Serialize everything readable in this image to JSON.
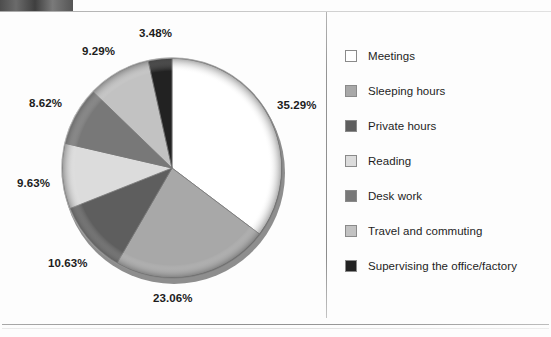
{
  "chart_data": {
    "type": "pie",
    "title": "",
    "categories": [
      "Meetings",
      "Sleeping hours",
      "Private hours",
      "Reading",
      "Desk work",
      "Travel and commuting",
      "Supervising the office/factory"
    ],
    "values": [
      35.29,
      23.06,
      10.63,
      9.63,
      8.62,
      9.29,
      3.48
    ],
    "value_labels": [
      "35.29%",
      "23.06%",
      "10.63%",
      "9.63%",
      "8.62%",
      "9.29%",
      "3.48%"
    ],
    "unit": "%",
    "colors": [
      "#ffffff",
      "#a8a8a8",
      "#5e5e5e",
      "#dcdcdc",
      "#787878",
      "#c2c2c2",
      "#222222"
    ],
    "start_angle_deg": 0,
    "direction": "clockwise",
    "legend_position": "right",
    "grid": false,
    "labels_outside": true
  },
  "legend": {
    "items": [
      {
        "label": "Meetings",
        "color": "#ffffff"
      },
      {
        "label": "Sleeping hours",
        "color": "#a8a8a8"
      },
      {
        "label": "Private hours",
        "color": "#5e5e5e"
      },
      {
        "label": "Reading",
        "color": "#dcdcdc"
      },
      {
        "label": "Desk work",
        "color": "#787878"
      },
      {
        "label": "Travel and commuting",
        "color": "#c2c2c2"
      },
      {
        "label": "Supervising the office/factory",
        "color": "#222222"
      }
    ]
  },
  "callouts": [
    {
      "text": "35.29%",
      "left": 277,
      "top": 99
    },
    {
      "text": "23.06%",
      "left": 153,
      "top": 292
    },
    {
      "text": "10.63%",
      "left": 48,
      "top": 257
    },
    {
      "text": "9.63%",
      "left": 17,
      "top": 177
    },
    {
      "text": "8.62%",
      "left": 29,
      "top": 97
    },
    {
      "text": "9.29%",
      "left": 82,
      "top": 45
    },
    {
      "text": "3.48%",
      "left": 139,
      "top": 27
    }
  ]
}
